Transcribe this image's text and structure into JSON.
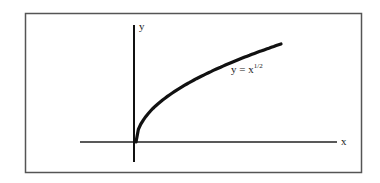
{
  "chart_data": {
    "type": "line",
    "title": "",
    "xlabel": "x",
    "ylabel": "y",
    "series": [
      {
        "name": "y = x^1/2",
        "function": "sqrt(x)",
        "x": [
          0,
          0.25,
          1,
          2.25,
          4,
          6.25,
          9
        ],
        "values": [
          0,
          0.5,
          1,
          1.5,
          2,
          2.5,
          3
        ]
      }
    ],
    "annotations": [
      {
        "text": "y = x",
        "superscript": "1/2",
        "position": "right of curve, mid-height"
      }
    ],
    "grid": false,
    "legend": "none",
    "frame": true
  },
  "labels": {
    "x_axis": "x",
    "y_axis": "y",
    "equation_base": "y = x",
    "equation_exp": "1/2"
  },
  "colors": {
    "line": "#111111",
    "frame": "#555555",
    "background": "#ffffff"
  }
}
